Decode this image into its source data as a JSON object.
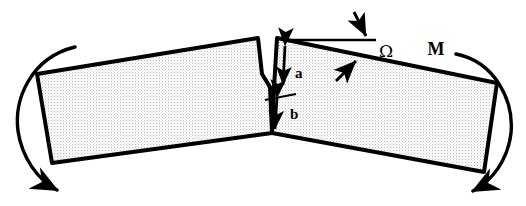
{
  "figure": {
    "type": "engineering-schematic",
    "background_color": "#ffffff",
    "line_color": "#000000",
    "body_fill_color": "#e2e2e2",
    "body_fill_pattern": "halftone-dither"
  },
  "labels": {
    "crack_depth": "a",
    "ligament_depth": "b",
    "crack_opening_angle": "Ω",
    "moment": "M"
  },
  "bodies": [
    {
      "name": "left-beam-segment",
      "points": "37,74 258,38 262,74 270,87 272,133 52,163"
    },
    {
      "name": "right-beam-segment",
      "points": "277,38 497,83 484,172 272,133 274,88"
    }
  ],
  "notch": {
    "name": "v-notch-crack",
    "mouth_left_x": 262,
    "mouth_right_x": 277,
    "apex_x": 270,
    "apex_y": 87
  },
  "dimension_lines": {
    "a": {
      "from_y": 42,
      "to_y": 88,
      "x": 285,
      "label_x": 296,
      "label_y": 76
    },
    "b": {
      "from_y": 97,
      "to_y": 131,
      "x": 279,
      "label_x": 293,
      "label_y": 118
    },
    "tick_line": {
      "x1": 266,
      "y1": 99,
      "x2": 295,
      "y2": 94
    }
  },
  "reference_line": {
    "name": "horizontal-datum",
    "x1": 287,
    "y1": 40,
    "x2": 376,
    "y2": 40
  },
  "moment_arrows": [
    {
      "name": "left-moment-arc",
      "direction": "counterclockwise",
      "side": "left"
    },
    {
      "name": "right-moment-arc",
      "direction": "clockwise",
      "side": "right"
    }
  ],
  "angle_indicators": [
    {
      "name": "datum-pointer-arrow",
      "target": "horizontal-datum"
    },
    {
      "name": "beam-edge-pointer-arrow",
      "target": "right-beam-top-edge"
    }
  ]
}
